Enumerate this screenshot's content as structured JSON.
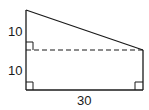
{
  "diagram": {
    "type": "geometry-figure",
    "shape": "right trapezoid split by dashed horizontal line",
    "labels": {
      "upper_left_side": "10",
      "lower_left_side": "10",
      "bottom_side": "30"
    },
    "right_angle_markers": 3,
    "colors": {
      "stroke": "#1a1a1a",
      "background": "#ffffff"
    }
  }
}
